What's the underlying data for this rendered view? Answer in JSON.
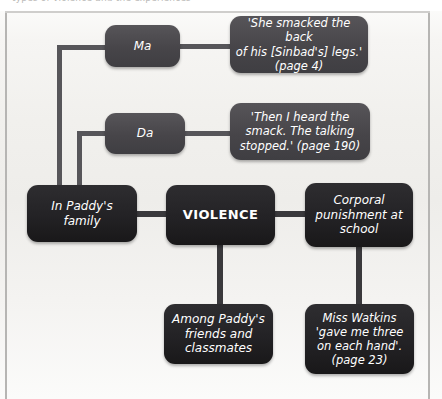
{
  "page": {
    "header_text": "types of violence and the experiences",
    "width": 442,
    "height": 399,
    "background": "#f2f1ef",
    "node_mid_color": "#4c4b4f",
    "node_dark_color": "#252427",
    "connector_color": "#57565a",
    "text_color": "#ffffff"
  },
  "diagram": {
    "type": "mind-map",
    "center": {
      "label": "VIOLENCE"
    },
    "branches": [
      {
        "id": "family",
        "label": "In Paddy's family",
        "children": [
          {
            "id": "ma",
            "label": "Ma",
            "quote": "'She smacked the back of his [Sinbad's] legs.' (page 4)"
          },
          {
            "id": "da",
            "label": "Da",
            "quote": "'Then I heard the smack. The talking stopped.' (page 190)"
          }
        ]
      },
      {
        "id": "friends",
        "label": "Among Paddy's friends and classmates",
        "children": []
      },
      {
        "id": "school",
        "label": "Corporal punishment at school",
        "children": [
          {
            "id": "watkins",
            "label": "",
            "quote": "Miss Watkins 'gave me three on each hand'. (page 23)"
          }
        ]
      }
    ],
    "nodes": {
      "ma": "Ma",
      "da": "Da",
      "ma_quote_line1": "'She smacked the back",
      "ma_quote_line2": "of his [Sinbad's] legs.'",
      "ma_quote_line3": "(page 4)",
      "da_quote_line1": "'Then I heard the",
      "da_quote_line2": "smack. The talking",
      "da_quote_line3": "stopped.' (page 190)",
      "family": "In Paddy's family",
      "violence": "VIOLENCE",
      "school_line1": "Corporal",
      "school_line2": "punishment at",
      "school_line3": "school",
      "friends_line1": "Among Paddy's",
      "friends_line2": "friends and",
      "friends_line3": "classmates",
      "watkins_line1": "Miss Watkins",
      "watkins_line2": "'gave me three",
      "watkins_line3": "on each hand'.",
      "watkins_line4": "(page 23)"
    }
  }
}
